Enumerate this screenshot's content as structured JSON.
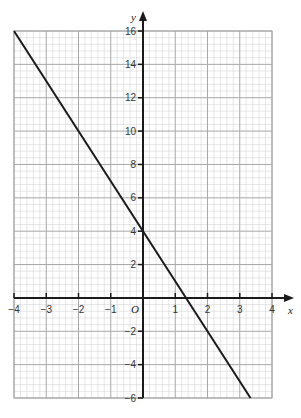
{
  "chart_data": {
    "type": "line",
    "title": "",
    "xlabel": "x",
    "ylabel": "y",
    "xlim": [
      -4,
      4
    ],
    "ylim": [
      -6,
      16
    ],
    "grid": true,
    "minor_grid_step": 0.2,
    "x_ticks": [
      -4,
      -3,
      -2,
      -1,
      0,
      1,
      2,
      3,
      4
    ],
    "x_tick_labels": [
      "−4",
      "−3",
      "−2",
      "−1",
      "0",
      "1",
      "2",
      "3",
      "4"
    ],
    "y_ticks": [
      -6,
      -4,
      -2,
      2,
      4,
      6,
      8,
      10,
      12,
      14,
      16
    ],
    "y_tick_labels": [
      "−6",
      "−4",
      "−2",
      "2",
      "4",
      "6",
      "8",
      "10",
      "12",
      "14",
      "16"
    ],
    "origin_label": "O",
    "series": [
      {
        "name": "y = 4 − 3x",
        "x": [
          -4,
          3.333
        ],
        "y": [
          16,
          -6
        ],
        "color": "#1a1a1a"
      }
    ],
    "legend": null
  },
  "colors": {
    "grid_minor": "#cfcfcf",
    "grid_major": "#a8a8a8",
    "axis": "#1a1a1a",
    "line": "#1a1a1a"
  }
}
